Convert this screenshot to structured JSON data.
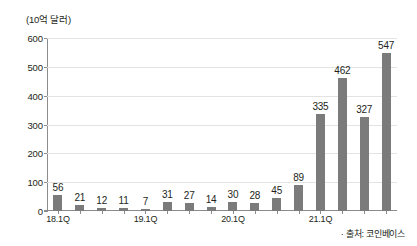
{
  "chart_data": {
    "type": "bar",
    "title": "",
    "subtitle": "",
    "xlabel": "",
    "ylabel": "(10억 달러)",
    "unit_caption": "(10억 달러)",
    "categories": [
      "18.1Q",
      "18.2Q",
      "18.3Q",
      "18.4Q",
      "19.1Q",
      "19.2Q",
      "19.3Q",
      "19.4Q",
      "20.1Q",
      "20.2Q",
      "20.3Q",
      "20.4Q",
      "21.1Q",
      "21.2Q",
      "21.3Q",
      "21.4Q"
    ],
    "values": [
      56,
      21,
      12,
      11,
      7,
      31,
      27,
      14,
      30,
      28,
      45,
      89,
      335,
      462,
      327,
      547
    ],
    "bar_labels": [
      "56",
      "21",
      "12",
      "11",
      "7",
      "31",
      "27",
      "14",
      "30",
      "28",
      "45",
      "89",
      "335",
      "462",
      "327",
      "547"
    ],
    "ylim": [
      0,
      600
    ],
    "ytick_values": [
      0,
      100,
      200,
      300,
      400,
      500,
      600
    ],
    "ytick_labels": [
      "0",
      "100",
      "200",
      "300",
      "400",
      "500",
      "600"
    ],
    "xtick_labels": [
      "18.1Q",
      "19.1Q",
      "20.1Q",
      "21.1Q"
    ],
    "xtick_indices": [
      0,
      4,
      8,
      12
    ],
    "grid": true,
    "legend": null,
    "bar_color": "#7b7b7b",
    "grid_color": "#e3e3e3",
    "axis_color": "#8c8c8c",
    "text_color": "#231f20"
  },
  "footer": {
    "source": "· 출처: 코인베이스"
  }
}
